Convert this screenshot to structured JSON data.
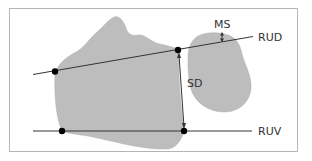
{
  "diagram": {
    "labels": {
      "ms": "MS",
      "rud": "RUD",
      "sd": "SD",
      "ruv": "RUV"
    },
    "colors": {
      "bone_fill": "#bdbdbd",
      "bone_stroke": "#a8a8a8",
      "line": "#333333",
      "frame": "#b5b5b5",
      "dot": "#000000"
    }
  }
}
